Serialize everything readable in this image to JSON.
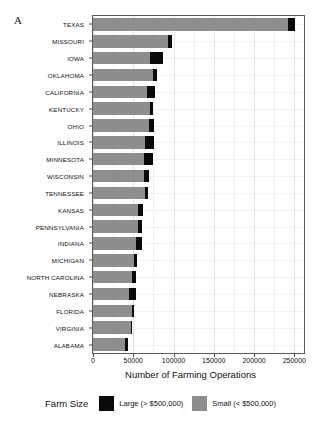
{
  "panel_label": "A",
  "axis": {
    "xlabel": "Number of Farming Operations",
    "ticks": [
      {
        "value": 0,
        "label": "0"
      },
      {
        "value": 50000,
        "label": "50000"
      },
      {
        "value": 100000,
        "label": "100000"
      },
      {
        "value": 150000,
        "label": "150000"
      },
      {
        "value": 200000,
        "label": "200000"
      },
      {
        "value": 250000,
        "label": "250000"
      }
    ],
    "xmin": 0,
    "xmax": 262000
  },
  "legend": {
    "title": "Farm Size",
    "items": [
      {
        "label": "Large (> $500,000)",
        "color": "#0a0a0a",
        "key": "large"
      },
      {
        "label": "Small (< $500,000)",
        "color": "#8e8e8e",
        "key": "small"
      }
    ]
  },
  "chart_data": {
    "type": "bar",
    "orientation": "horizontal",
    "stacked": true,
    "title": "A",
    "xlabel": "Number of Farming Operations",
    "ylabel": "",
    "xlim": [
      0,
      262000
    ],
    "grid": true,
    "legend_position": "bottom",
    "legend_title": "Farm Size",
    "categories": [
      "TEXAS",
      "MISSOURI",
      "IOWA",
      "OKLAHOMA",
      "CALIFORNIA",
      "KENTUCKY",
      "OHIO",
      "ILLINOIS",
      "MINNESOTA",
      "WISCONSIN",
      "TENNESSEE",
      "KANSAS",
      "PENNSYLVANIA",
      "INDIANA",
      "MICHIGAN",
      "NORTH CAROLINA",
      "NEBRASKA",
      "FLORIDA",
      "VIRGINIA",
      "ALABAMA"
    ],
    "series": [
      {
        "name": "Small (< $500,000)",
        "color": "#8e8e8e",
        "values": [
          242000,
          93500,
          71000,
          74500,
          67000,
          71000,
          70000,
          64500,
          63500,
          63000,
          64500,
          55500,
          55500,
          53500,
          50500,
          48000,
          45000,
          48000,
          47000,
          39500
        ]
      },
      {
        "name": "Large (> $500,000)",
        "color": "#0a0a0a",
        "values": [
          9000,
          5000,
          16000,
          5500,
          9500,
          3000,
          5500,
          11500,
          11500,
          7000,
          3500,
          6500,
          5000,
          7000,
          4000,
          5500,
          8500,
          2500,
          2000,
          3500
        ]
      }
    ],
    "totals": [
      251000,
      98500,
      87000,
      80000,
      76500,
      74000,
      75500,
      76000,
      75000,
      70000,
      68000,
      62000,
      60500,
      60500,
      54500,
      53500,
      53500,
      50500,
      49000,
      43000
    ]
  }
}
